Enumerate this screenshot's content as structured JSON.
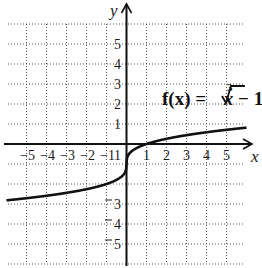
{
  "chart_data": {
    "type": "line",
    "title": "",
    "annotation": "f(x) = ∛x − 1",
    "annotation_parts": {
      "lhs": "f(x) = ",
      "index": "3",
      "radicand": "x",
      "rhs": " − 1"
    },
    "xlabel": "x",
    "ylabel": "y",
    "xlim": [
      -6,
      6
    ],
    "ylim": [
      -6,
      6
    ],
    "grid": true,
    "x_ticks": [
      -5,
      -4,
      -3,
      -2,
      -1,
      1,
      2,
      3,
      4,
      5
    ],
    "y_ticks": [
      5,
      4,
      3,
      2,
      1,
      -1,
      -3,
      -4,
      -5
    ],
    "x_tick_labels": [
      "−5",
      "−4",
      "−3",
      "−2",
      "−1",
      "1",
      "2",
      "3",
      "4",
      "5"
    ],
    "y_tick_labels_pos": [
      "5",
      "4",
      "3",
      "2",
      "1"
    ],
    "y_tick_labels_neg": [
      "1",
      "3",
      "4",
      "5"
    ],
    "series": [
      {
        "name": "f(x) = cbrt(x) - 1",
        "x": [
          -6,
          -5,
          -4,
          -3,
          -2,
          -1,
          -0.5,
          -0.1,
          0,
          0.1,
          0.5,
          1,
          2,
          3,
          4,
          5,
          6
        ],
        "values": [
          -2.82,
          -2.71,
          -2.59,
          -2.44,
          -2.26,
          -2.0,
          -1.79,
          -1.46,
          -1.0,
          -0.54,
          -0.21,
          0.0,
          0.26,
          0.44,
          0.59,
          0.71,
          0.82
        ]
      }
    ]
  },
  "colors": {
    "curve": "#111111",
    "axis": "#111111",
    "grid": "#555555"
  }
}
